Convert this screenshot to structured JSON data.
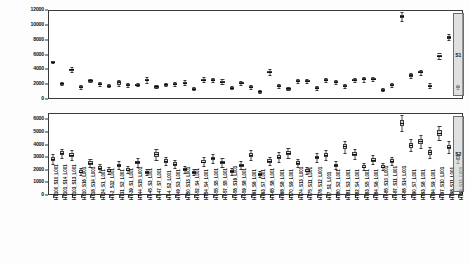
{
  "figure": {
    "background": "#fdfdfd",
    "box_fill": "#d9d9d9",
    "line_color": "#3a3a3a",
    "highlight_fill": "#cdcdcd"
  },
  "chart_data": [
    {
      "type": "box",
      "title": "",
      "xlabel": "",
      "ylabel": "",
      "ylim": [
        0,
        12000
      ],
      "yticks": [
        0,
        2000,
        4000,
        6000,
        8000,
        10000,
        12000
      ],
      "ytick_labels": [
        "0",
        "2000",
        "4000",
        "6000",
        "8000",
        "10000",
        "12000"
      ],
      "grid": false,
      "legend": "none",
      "categories": [
        "HT100_S10_L001",
        "HT101_S14_L001",
        "HT103_S13_L001",
        "HT10_S16_L001",
        "HT18_S14_L001",
        "HT24_S1_L001",
        "HT-2_S12_L001",
        "HT31_S2_L001",
        "HT-39_S1_L001",
        "HT44_S15_L001",
        "HT-45_S3_L001",
        "HT-47_S7_L001",
        "HT-4_S2_L001",
        "HT49_S3_L001",
        "HT50_S13_L001",
        "HT-52_S4_L001",
        "HT54_S4_L001",
        "HT-55_S5_L001",
        "HT-57_S5_L001",
        "HT-58_S16_L001",
        "HT-59_S8_L001",
        "HT61_S6_L001",
        "HT63_S7_L001",
        "HT-65_S8_L001",
        "HT68_S8_L001",
        "HT70_S9_L001",
        "HT74_S13_L001",
        "HT75_S11_L001",
        "HT78_S12_L001",
        "HT7_S1_L001",
        "HT80_S2_L001",
        "HT81_S3_L001",
        "HT82_S4_L001",
        "HT83_S5_L001",
        "HT84_S6_L001",
        "HT-85_S10_L001",
        "HT-87_S11_L001",
        "HT-88_S14_L001",
        "HT90_S7_L001",
        "HT93_S8_L001",
        "HT94_S9_L001",
        "HT97_S10_L001",
        "HT98_S11_L001",
        "HT99_S12_L001"
      ],
      "boxes": [
        {
          "min": 4850,
          "q1": 4950,
          "median": 5020,
          "q3": 5080,
          "max": 5180
        },
        {
          "min": 1950,
          "q1": 2080,
          "median": 2150,
          "q3": 2220,
          "max": 2350
        },
        {
          "min": 3650,
          "q1": 3850,
          "median": 3980,
          "q3": 4090,
          "max": 4300
        },
        {
          "min": 1400,
          "q1": 1560,
          "median": 1660,
          "q3": 1760,
          "max": 1920
        },
        {
          "min": 2250,
          "q1": 2400,
          "median": 2500,
          "q3": 2590,
          "max": 2720
        },
        {
          "min": 1800,
          "q1": 1930,
          "median": 2020,
          "q3": 2110,
          "max": 2260
        },
        {
          "min": 1600,
          "q1": 1720,
          "median": 1800,
          "q3": 1880,
          "max": 2010
        },
        {
          "min": 1700,
          "q1": 1850,
          "median": 2350,
          "q3": 2450,
          "max": 2560
        },
        {
          "min": 1650,
          "q1": 1780,
          "median": 1870,
          "q3": 1960,
          "max": 2100
        },
        {
          "min": 1700,
          "q1": 1830,
          "median": 1930,
          "q3": 2030,
          "max": 2180
        },
        {
          "min": 2200,
          "q1": 2380,
          "median": 2560,
          "q3": 2680,
          "max": 2900
        },
        {
          "min": 1500,
          "q1": 1620,
          "median": 1720,
          "q3": 1810,
          "max": 1950
        },
        {
          "min": 1750,
          "q1": 1880,
          "median": 1980,
          "q3": 2070,
          "max": 2210
        },
        {
          "min": 1800,
          "q1": 1940,
          "median": 2050,
          "q3": 2160,
          "max": 2320
        },
        {
          "min": 1850,
          "q1": 2060,
          "median": 2220,
          "q3": 2340,
          "max": 2520
        },
        {
          "min": 1150,
          "q1": 1280,
          "median": 1380,
          "q3": 1470,
          "max": 1620
        },
        {
          "min": 2300,
          "q1": 2480,
          "median": 2620,
          "q3": 2740,
          "max": 2920
        },
        {
          "min": 2250,
          "q1": 2430,
          "median": 2580,
          "q3": 2690,
          "max": 2860
        },
        {
          "min": 2050,
          "q1": 2220,
          "median": 2350,
          "q3": 2460,
          "max": 2640
        },
        {
          "min": 1350,
          "q1": 1460,
          "median": 1550,
          "q3": 1640,
          "max": 1780
        },
        {
          "min": 1950,
          "q1": 2080,
          "median": 2180,
          "q3": 2280,
          "max": 2430
        },
        {
          "min": 1400,
          "q1": 1530,
          "median": 1650,
          "q3": 1760,
          "max": 1900
        },
        {
          "min": 800,
          "q1": 920,
          "median": 1020,
          "q3": 1110,
          "max": 1250
        },
        {
          "min": 3250,
          "q1": 3480,
          "median": 3680,
          "q3": 3840,
          "max": 4070
        },
        {
          "min": 1500,
          "q1": 1650,
          "median": 1760,
          "q3": 1870,
          "max": 2030
        },
        {
          "min": 1200,
          "q1": 1320,
          "median": 1420,
          "q3": 1520,
          "max": 1660
        },
        {
          "min": 2100,
          "q1": 2280,
          "median": 2420,
          "q3": 2540,
          "max": 2720
        },
        {
          "min": 2200,
          "q1": 2360,
          "median": 2480,
          "q3": 2590,
          "max": 2760
        },
        {
          "min": 1250,
          "q1": 1380,
          "median": 1480,
          "q3": 1580,
          "max": 1720
        },
        {
          "min": 2250,
          "q1": 2420,
          "median": 2550,
          "q3": 2660,
          "max": 2830
        },
        {
          "min": 2050,
          "q1": 2200,
          "median": 2320,
          "q3": 2430,
          "max": 2590
        },
        {
          "min": 1550,
          "q1": 1680,
          "median": 1790,
          "q3": 1890,
          "max": 2040
        },
        {
          "min": 2250,
          "q1": 2420,
          "median": 2550,
          "q3": 2660,
          "max": 2830
        },
        {
          "min": 2350,
          "q1": 2520,
          "median": 2650,
          "q3": 2770,
          "max": 2950
        },
        {
          "min": 2400,
          "q1": 2580,
          "median": 2720,
          "q3": 2840,
          "max": 3020
        },
        {
          "min": 1050,
          "q1": 1180,
          "median": 1280,
          "q3": 1380,
          "max": 1520
        },
        {
          "min": 1650,
          "q1": 1800,
          "median": 1920,
          "q3": 2030,
          "max": 2190
        },
        {
          "min": 10550,
          "q1": 10920,
          "median": 11150,
          "q3": 11380,
          "max": 11750
        },
        {
          "min": 2800,
          "q1": 3020,
          "median": 3180,
          "q3": 3320,
          "max": 3540
        },
        {
          "min": 3250,
          "q1": 3460,
          "median": 3620,
          "q3": 3760,
          "max": 3970
        },
        {
          "min": 1550,
          "q1": 1700,
          "median": 1820,
          "q3": 1930,
          "max": 2090
        },
        {
          "min": 5450,
          "q1": 5680,
          "median": 5850,
          "q3": 6000,
          "max": 6230
        },
        {
          "min": 7900,
          "q1": 8150,
          "median": 8330,
          "q3": 8500,
          "max": 8750
        },
        {
          "min": 1350,
          "q1": 1490,
          "median": 1600,
          "q3": 1700,
          "max": 1850
        }
      ],
      "highlight": {
        "index": 43,
        "label": "S1"
      }
    },
    {
      "type": "box",
      "title": "",
      "xlabel": "",
      "ylabel": "",
      "ylim": [
        0,
        6500
      ],
      "yticks": [
        0,
        1000,
        2000,
        3000,
        4000,
        5000,
        6000
      ],
      "ytick_labels": [
        "0",
        "1000",
        "2000",
        "3000",
        "4000",
        "5000",
        "6000"
      ],
      "grid": false,
      "legend": "none",
      "categories": [
        "HT100_S10_L001",
        "HT101_S14_L001",
        "HT103_S13_L001",
        "HT10_S16_L001",
        "HT18_S14_L001",
        "HT24_S1_L001",
        "HT-2_S12_L001",
        "HT31_S2_L001",
        "HT-39_S1_L001",
        "HT44_S15_L001",
        "HT-45_S3_L001",
        "HT-47_S7_L001",
        "HT-4_S2_L001",
        "HT49_S3_L001",
        "HT50_S13_L001",
        "HT-52_S4_L001",
        "HT54_S4_L001",
        "HT-55_S5_L001",
        "HT-57_S5_L001",
        "HT-58_S16_L001",
        "HT-59_S8_L001",
        "HT61_S6_L001",
        "HT63_S7_L001",
        "HT-65_S8_L001",
        "HT68_S8_L001",
        "HT70_S9_L001",
        "HT74_S13_L001",
        "HT75_S11_L001",
        "HT78_S12_L001",
        "HT7_S1_L001",
        "HT80_S2_L001",
        "HT81_S3_L001",
        "HT82_S4_L001",
        "HT83_S5_L001",
        "HT84_S6_L001",
        "HT-85_S10_L001",
        "HT-87_S11_L001",
        "HT-88_S14_L001",
        "HT90_S7_L001",
        "HT93_S8_L001",
        "HT94_S9_L001",
        "HT97_S10_L001",
        "HT98_S11_L001",
        "HT99_S12_L001"
      ],
      "boxes": [
        {
          "min": 2450,
          "q1": 2700,
          "median": 2870,
          "q3": 3010,
          "max": 3250
        },
        {
          "min": 2950,
          "q1": 3180,
          "median": 3330,
          "q3": 3460,
          "max": 3680
        },
        {
          "min": 2750,
          "q1": 2980,
          "median": 3160,
          "q3": 3310,
          "max": 3550
        },
        {
          "min": 1600,
          "q1": 1750,
          "median": 1860,
          "q3": 1960,
          "max": 2120
        },
        {
          "min": 2200,
          "q1": 2400,
          "median": 2540,
          "q3": 2660,
          "max": 2860
        },
        {
          "min": 1850,
          "q1": 2020,
          "median": 2150,
          "q3": 2260,
          "max": 2440
        },
        {
          "min": 1650,
          "q1": 1800,
          "median": 1920,
          "q3": 2030,
          "max": 2200
        },
        {
          "min": 2050,
          "q1": 2220,
          "median": 2350,
          "q3": 2470,
          "max": 2660
        },
        {
          "min": 1750,
          "q1": 1900,
          "median": 2020,
          "q3": 2130,
          "max": 2300
        },
        {
          "min": 2250,
          "q1": 2450,
          "median": 2600,
          "q3": 2720,
          "max": 2930
        },
        {
          "min": 1550,
          "q1": 1700,
          "median": 1820,
          "q3": 1930,
          "max": 2100
        },
        {
          "min": 2800,
          "q1": 3050,
          "median": 3230,
          "q3": 3380,
          "max": 3620
        },
        {
          "min": 2350,
          "q1": 2550,
          "median": 2700,
          "q3": 2830,
          "max": 3040
        },
        {
          "min": 2150,
          "q1": 2330,
          "median": 2470,
          "q3": 2590,
          "max": 2780
        },
        {
          "min": 1750,
          "q1": 1910,
          "median": 2040,
          "q3": 2150,
          "max": 2330
        },
        {
          "min": 1550,
          "q1": 1700,
          "median": 1820,
          "q3": 1930,
          "max": 2100
        },
        {
          "min": 2300,
          "q1": 2500,
          "median": 2650,
          "q3": 2780,
          "max": 2980
        },
        {
          "min": 2550,
          "q1": 2760,
          "median": 2910,
          "q3": 3050,
          "max": 3260
        },
        {
          "min": 2250,
          "q1": 2440,
          "median": 2580,
          "q3": 2710,
          "max": 2900
        },
        {
          "min": 1600,
          "q1": 1750,
          "median": 1870,
          "q3": 1980,
          "max": 2150
        },
        {
          "min": 2050,
          "q1": 2230,
          "median": 2370,
          "q3": 2490,
          "max": 2680
        },
        {
          "min": 2750,
          "q1": 2980,
          "median": 3160,
          "q3": 3310,
          "max": 3550
        },
        {
          "min": 1400,
          "q1": 1540,
          "median": 1650,
          "q3": 1750,
          "max": 1910
        },
        {
          "min": 2350,
          "q1": 2550,
          "median": 2700,
          "q3": 2830,
          "max": 3040
        },
        {
          "min": 2650,
          "q1": 2870,
          "median": 3040,
          "q3": 3180,
          "max": 3400
        },
        {
          "min": 2900,
          "q1": 3150,
          "median": 3330,
          "q3": 3480,
          "max": 3720
        },
        {
          "min": 2200,
          "q1": 2390,
          "median": 2540,
          "q3": 2660,
          "max": 2860
        },
        {
          "min": 1650,
          "q1": 1800,
          "median": 1920,
          "q3": 2030,
          "max": 2200
        },
        {
          "min": 2600,
          "q1": 2820,
          "median": 2980,
          "q3": 3120,
          "max": 3340
        },
        {
          "min": 2750,
          "q1": 2980,
          "median": 3150,
          "q3": 3300,
          "max": 3530
        },
        {
          "min": 2050,
          "q1": 2230,
          "median": 2370,
          "q3": 2490,
          "max": 2680
        },
        {
          "min": 3350,
          "q1": 3650,
          "median": 3850,
          "q3": 4030,
          "max": 4320
        },
        {
          "min": 2850,
          "q1": 3090,
          "median": 3270,
          "q3": 3420,
          "max": 3660
        },
        {
          "min": 1950,
          "q1": 2120,
          "median": 2250,
          "q3": 2370,
          "max": 2550
        },
        {
          "min": 2450,
          "q1": 2650,
          "median": 2810,
          "q3": 2940,
          "max": 3150
        },
        {
          "min": 1950,
          "q1": 2120,
          "median": 2250,
          "q3": 2370,
          "max": 2550
        },
        {
          "min": 2350,
          "q1": 2550,
          "median": 2700,
          "q3": 2830,
          "max": 3040
        },
        {
          "min": 5050,
          "q1": 5450,
          "median": 5720,
          "q3": 5950,
          "max": 6330
        },
        {
          "min": 3450,
          "q1": 3740,
          "median": 3940,
          "q3": 4110,
          "max": 4400
        },
        {
          "min": 3750,
          "q1": 4060,
          "median": 4280,
          "q3": 4470,
          "max": 4780
        },
        {
          "min": 2950,
          "q1": 3190,
          "median": 3370,
          "q3": 3530,
          "max": 3770
        },
        {
          "min": 4350,
          "q1": 4700,
          "median": 4940,
          "q3": 5140,
          "max": 5490
        },
        {
          "min": 3350,
          "q1": 3630,
          "median": 3830,
          "q3": 4000,
          "max": 4290
        },
        {
          "min": 2550,
          "q1": 2760,
          "median": 2920,
          "q3": 3060,
          "max": 3280
        }
      ],
      "highlight": {
        "index": 43,
        "label": "S2"
      }
    }
  ]
}
